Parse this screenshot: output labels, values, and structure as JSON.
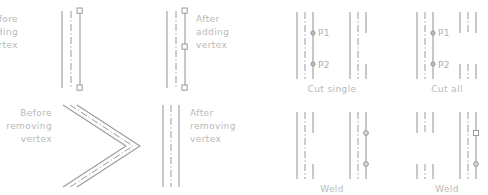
{
  "figure": {
    "background_color": "#ffffff",
    "line_color": "#9a9a9a",
    "text_color": "#b9b9b9"
  },
  "panels": [
    {
      "id": "before-adding-vertex",
      "label": "Before\nadding\nvertex",
      "label_lines": [
        "Before",
        "adding",
        "vertex"
      ],
      "caption": ""
    },
    {
      "id": "after-adding-vertex",
      "label_lines": [
        "After",
        "adding",
        "vertex"
      ],
      "caption": ""
    },
    {
      "id": "before-removing-vertex",
      "label_lines": [
        "Before",
        "removing",
        "vertex"
      ],
      "caption": ""
    },
    {
      "id": "after-removing-vertex",
      "label_lines": [
        "After",
        "removing",
        "vertex"
      ],
      "caption": ""
    },
    {
      "id": "cut-single",
      "label_lines": [],
      "caption": "Cut  single"
    },
    {
      "id": "cut-all",
      "label_lines": [],
      "caption": "Cut  all"
    },
    {
      "id": "weld-single",
      "label_lines": [],
      "caption": "Weld"
    },
    {
      "id": "weld-all",
      "label_lines": [],
      "caption": "Weld"
    }
  ],
  "labels": {
    "before_adding": [
      "Before",
      "adding",
      "vertex"
    ],
    "after_adding": [
      "After",
      "adding",
      "vertex"
    ],
    "before_removing": [
      "Before",
      "removing",
      "vertex"
    ],
    "after_removing": [
      "After",
      "removing",
      "vertex"
    ],
    "cut_single": "Cut  single",
    "cut_all": "Cut  all",
    "weld_1": "Weld",
    "weld_2": "Weld"
  },
  "points": {
    "p1": "P1",
    "p2": "P2",
    "p1_b": "P1",
    "p2_b": "P2"
  }
}
